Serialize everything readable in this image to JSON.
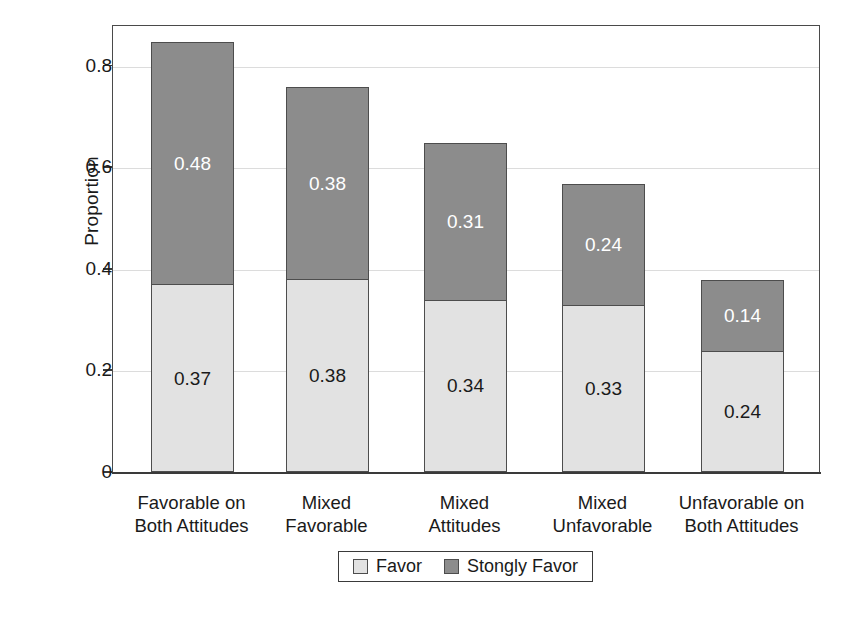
{
  "chart_data": {
    "type": "bar",
    "subtype": "stacked-bar",
    "title": "",
    "xlabel": "",
    "ylabel": "Proportion",
    "ylim": [
      0,
      0.88
    ],
    "ytick_labels": [
      "0",
      "0.2",
      "0.4",
      "0.6",
      "0.8"
    ],
    "ytick_values": [
      0,
      0.2,
      0.4,
      0.6,
      0.8
    ],
    "grid": true,
    "grid_axis": "y",
    "legend_position": "bottom-center",
    "categories": [
      "Favorable on Both Attitudes",
      "Mixed Favorable",
      "Mixed Attitudes",
      "Mixed Unfavorable",
      "Unfavorable on Both Attitudes"
    ],
    "category_lines": [
      [
        "Favorable on",
        "Both Attitudes"
      ],
      [
        "Mixed",
        "Favorable"
      ],
      [
        "Mixed",
        "Attitudes"
      ],
      [
        "Mixed",
        "Unfavorable"
      ],
      [
        "Unfavorable on",
        "Both Attitudes"
      ]
    ],
    "series": [
      {
        "name": "Favor",
        "color": "#e2e2e2",
        "values": [
          0.37,
          0.38,
          0.34,
          0.33,
          0.24
        ],
        "labels": [
          "0.37",
          "0.38",
          "0.34",
          "0.33",
          "0.24"
        ]
      },
      {
        "name": "Stongly Favor",
        "color": "#8c8c8c",
        "values": [
          0.48,
          0.38,
          0.31,
          0.24,
          0.14
        ],
        "labels": [
          "0.48",
          "0.38",
          "0.31",
          "0.24",
          "0.14"
        ]
      }
    ],
    "totals": [
      0.84,
      0.76,
      0.64,
      0.57,
      0.38
    ]
  },
  "legend": {
    "items": [
      {
        "label": "Favor",
        "swatch": "favor"
      },
      {
        "label": "Stongly Favor",
        "swatch": "strong"
      }
    ]
  },
  "colors": {
    "favor": "#e2e2e2",
    "strongly_favor": "#8c8c8c",
    "axis": "#3a3a3a",
    "grid": "#dcdcdc",
    "text": "#1a1a1a"
  }
}
